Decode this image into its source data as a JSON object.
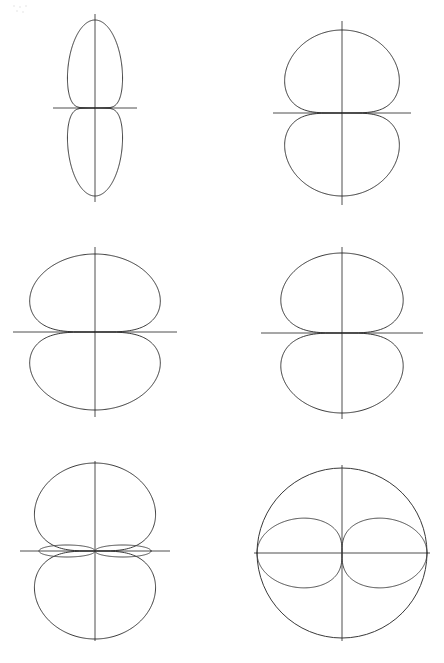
{
  "page": {
    "background_color": "#ffffff",
    "line_color": "#2e2e2e",
    "axis_color": "#3b3b3b",
    "width": 444,
    "height": 663,
    "columns": 2,
    "rows": 3
  },
  "chart_data": [
    {
      "id": "panel-1",
      "type": "line",
      "plot_style": "polar",
      "title": "",
      "xlabel": "",
      "ylabel": "",
      "grid": false,
      "legend": null,
      "axes": {
        "center_x": 95,
        "center_y": 108,
        "horizontal_half_length": 42,
        "vertical_half_length": 94,
        "horizontal": true,
        "vertical": true
      },
      "description": "Narrow vertical two-lobe figure-eight pattern, lobes along vertical axis",
      "curves": [
        {
          "name": "narrow-vertical-lobes",
          "form": "cos_power",
          "exponent": 8,
          "orientation": "vertical",
          "scale_x": 36,
          "scale_y": 88,
          "bulge": 0.62,
          "mirror": "both"
        }
      ]
    },
    {
      "id": "panel-2",
      "type": "line",
      "plot_style": "polar",
      "title": "",
      "xlabel": "",
      "ylabel": "",
      "grid": false,
      "legend": null,
      "axes": {
        "center_x": 120,
        "center_y": 113,
        "horizontal_half_length": 69,
        "vertical_half_length": 92,
        "horizontal": true,
        "vertical": true
      },
      "description": "Broad teardrop two-lobe pattern, wide cardioid-like lobes above and below axis",
      "curves": [
        {
          "name": "broad-teardrop-lobes",
          "form": "cos_power",
          "exponent": 1.5,
          "orientation": "vertical",
          "scale_x": 82,
          "scale_y": 83,
          "bulge": 1.38,
          "mirror": "both"
        }
      ]
    },
    {
      "id": "panel-3",
      "type": "line",
      "plot_style": "polar",
      "title": "",
      "xlabel": "",
      "ylabel": "",
      "grid": false,
      "legend": null,
      "axes": {
        "center_x": 95,
        "center_y": 332,
        "horizontal_half_length": 82,
        "vertical_half_length": 85,
        "horizontal": true,
        "vertical": true
      },
      "description": "Wide rounded two-lobe pattern with flattened shoulders, nearly circular halves",
      "curves": [
        {
          "name": "wide-rounded-lobes",
          "form": "cos_power",
          "exponent": 0.95,
          "orientation": "vertical",
          "scale_x": 95,
          "scale_y": 78,
          "bulge": 1.62,
          "mirror": "both"
        }
      ]
    },
    {
      "id": "panel-4",
      "type": "line",
      "plot_style": "polar",
      "title": "",
      "xlabel": "",
      "ylabel": "",
      "grid": false,
      "legend": null,
      "axes": {
        "center_x": 120,
        "center_y": 112,
        "horizontal_half_length": 81,
        "vertical_half_length": 86,
        "horizontal": true,
        "vertical": true
      },
      "description": "Two nearly elliptical lobes meeting tangentially at the horizontal axis",
      "curves": [
        {
          "name": "elliptical-lobes",
          "form": "cos_power",
          "exponent": 0.45,
          "orientation": "vertical",
          "scale_x": 92,
          "scale_y": 80,
          "bulge": 1.86,
          "mirror": "both"
        }
      ]
    },
    {
      "id": "panel-5",
      "type": "line",
      "plot_style": "polar",
      "title": "",
      "xlabel": "",
      "ylabel": "",
      "grid": false,
      "legend": null,
      "axes": {
        "center_x": 95,
        "center_y": 551,
        "horizontal_half_length": 75,
        "vertical_half_length": 90,
        "horizontal": true,
        "vertical": true
      },
      "description": "Two large main lobes plus four thin side lobes lying along the horizontal axis",
      "curves": [
        {
          "name": "main-lobes",
          "form": "cos_power",
          "exponent": 0.34,
          "orientation": "vertical",
          "scale_x": 92,
          "scale_y": 88,
          "bulge": 1.92,
          "mirror": "both"
        },
        {
          "name": "side-lobes",
          "form": "thin_ellipse_pair",
          "half_length": 56,
          "half_width": 6,
          "mirror": "horizontal"
        }
      ]
    },
    {
      "id": "panel-6",
      "type": "line",
      "plot_style": "polar",
      "title": "",
      "xlabel": "",
      "ylabel": "",
      "grid": false,
      "legend": null,
      "axes": {
        "center_x": 120,
        "center_y": 111,
        "horizontal_half_length": 88,
        "vertical_half_length": 88,
        "horizontal": true,
        "vertical": true
      },
      "description": "Circle (omnidirectional) overlaid with a horizontal figure-eight two-lobe pattern",
      "curves": [
        {
          "name": "omnidirectional-circle",
          "form": "circle",
          "radius": 85
        },
        {
          "name": "horizontal-figure-eight",
          "form": "cos_power",
          "exponent": 1.0,
          "orientation": "horizontal",
          "scale_x": 85,
          "scale_y": 57,
          "bulge": 1.0,
          "mirror": "both"
        }
      ]
    }
  ]
}
